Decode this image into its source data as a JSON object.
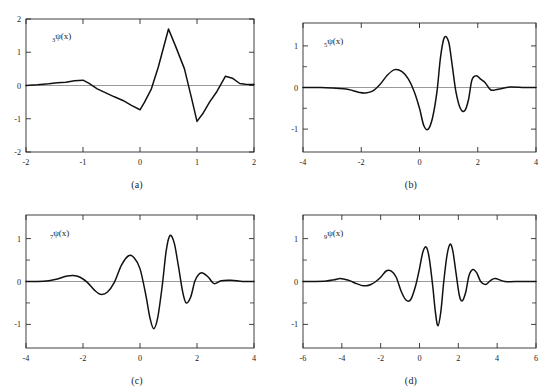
{
  "figure": {
    "background": "#ffffff",
    "axis_color": "#2b2b2b",
    "curve_color": "#111111",
    "zero_line_color": "#6f6f6f"
  },
  "panels": [
    {
      "id": "a",
      "caption": "(a)",
      "curve_label_sub": "3",
      "curve_label_main": "ψ(x)"
    },
    {
      "id": "b",
      "caption": "(b)",
      "curve_label_sub": "5",
      "curve_label_main": "ψ(x)"
    },
    {
      "id": "c",
      "caption": "(c)",
      "curve_label_sub": "7",
      "curve_label_main": "ψ(x)"
    },
    {
      "id": "d",
      "caption": "(d)",
      "curve_label_sub": "9",
      "curve_label_main": "ψ(x)"
    }
  ],
  "chart_data": [
    {
      "type": "line",
      "panel": "a",
      "title": "",
      "annotation": "3ψ(x)",
      "xlabel": "",
      "ylabel": "",
      "xlim": [
        -2,
        2
      ],
      "ylim": [
        -2,
        2
      ],
      "xticks": [
        -2,
        -1,
        0,
        1,
        2
      ],
      "xticklabels": [
        "-2",
        "-1",
        "0",
        "1",
        "2"
      ],
      "yticks": [
        -2,
        -1,
        0,
        1,
        2
      ],
      "yticklabels": [
        "-2",
        "-1",
        "0",
        "1",
        "2"
      ],
      "grid": false,
      "legend": "none",
      "zero_line": true,
      "interpolation": "linear",
      "x": [
        -2.0,
        -1.8,
        -1.6,
        -1.45,
        -1.3,
        -1.15,
        -1.0,
        -0.9,
        -0.75,
        -0.6,
        -0.45,
        -0.3,
        -0.15,
        0.0,
        0.08,
        0.2,
        0.32,
        0.5,
        0.62,
        0.78,
        0.9,
        1.0,
        1.1,
        1.22,
        1.35,
        1.5,
        1.62,
        1.75,
        1.85,
        2.0
      ],
      "values": [
        0.0,
        0.02,
        0.05,
        0.08,
        0.1,
        0.14,
        0.16,
        0.07,
        -0.1,
        -0.22,
        -0.34,
        -0.45,
        -0.6,
        -0.73,
        -0.5,
        -0.1,
        0.55,
        1.7,
        1.2,
        0.5,
        -0.35,
        -1.08,
        -0.85,
        -0.5,
        -0.18,
        0.28,
        0.22,
        0.06,
        0.04,
        0.03
      ]
    },
    {
      "type": "line",
      "panel": "b",
      "title": "",
      "annotation": "5ψ(x)",
      "xlabel": "",
      "ylabel": "",
      "xlim": [
        -4,
        4
      ],
      "ylim": [
        -1.55,
        1.55
      ],
      "xticks": [
        -4,
        -2,
        0,
        2,
        4
      ],
      "xticklabels": [
        "-4",
        "-2",
        "0",
        "2",
        "4"
      ],
      "yticks": [
        -1,
        0,
        1
      ],
      "yticklabels": [
        "-1",
        "0",
        "1"
      ],
      "yminorticks": [
        -0.5,
        0.5
      ],
      "grid": false,
      "legend": "none",
      "zero_line": true,
      "interpolation": "smooth",
      "x": [
        -4.0,
        -3.4,
        -3.0,
        -2.6,
        -2.3,
        -2.05,
        -1.85,
        -1.6,
        -1.35,
        -1.1,
        -0.85,
        -0.6,
        -0.38,
        -0.18,
        0.0,
        0.15,
        0.3,
        0.45,
        0.6,
        0.72,
        0.85,
        1.0,
        1.12,
        1.25,
        1.4,
        1.55,
        1.68,
        1.8,
        1.95,
        2.1,
        2.25,
        2.45,
        2.7,
        3.1,
        3.6,
        4.0
      ],
      "values": [
        0.0,
        0.0,
        -0.01,
        -0.03,
        -0.07,
        -0.12,
        -0.13,
        -0.08,
        0.08,
        0.3,
        0.43,
        0.38,
        0.2,
        -0.1,
        -0.5,
        -0.92,
        -1.0,
        -0.72,
        -0.1,
        0.72,
        1.2,
        1.1,
        0.55,
        -0.1,
        -0.5,
        -0.56,
        -0.3,
        0.18,
        0.28,
        0.2,
        0.12,
        -0.06,
        -0.04,
        0.01,
        0.0,
        0.0
      ]
    },
    {
      "type": "line",
      "panel": "c",
      "title": "",
      "annotation": "7ψ(x)",
      "xlabel": "",
      "ylabel": "",
      "xlim": [
        -4,
        4
      ],
      "ylim": [
        -1.55,
        1.55
      ],
      "xticks": [
        -4,
        -2,
        0,
        2,
        4
      ],
      "xticklabels": [
        "-4",
        "-2",
        "0",
        "2",
        "4"
      ],
      "yticks": [
        -1,
        0,
        1
      ],
      "yticklabels": [
        "-1",
        "0",
        "1"
      ],
      "yminorticks": [
        -0.5,
        0.5
      ],
      "grid": false,
      "legend": "none",
      "zero_line": true,
      "interpolation": "smooth",
      "x": [
        -4.0,
        -3.6,
        -3.2,
        -2.9,
        -2.6,
        -2.35,
        -2.1,
        -1.85,
        -1.6,
        -1.38,
        -1.15,
        -0.9,
        -0.65,
        -0.4,
        -0.2,
        0.0,
        0.2,
        0.35,
        0.48,
        0.62,
        0.78,
        0.92,
        1.05,
        1.2,
        1.35,
        1.5,
        1.62,
        1.78,
        1.92,
        2.05,
        2.2,
        2.4,
        2.6,
        2.85,
        3.2,
        3.6,
        4.0
      ],
      "values": [
        0.0,
        0.0,
        0.02,
        0.06,
        0.12,
        0.14,
        0.1,
        -0.02,
        -0.2,
        -0.3,
        -0.25,
        -0.02,
        0.38,
        0.6,
        0.55,
        0.3,
        -0.3,
        -0.85,
        -1.1,
        -0.85,
        -0.1,
        0.72,
        1.07,
        0.9,
        0.35,
        -0.25,
        -0.5,
        -0.36,
        0.0,
        0.16,
        0.2,
        0.1,
        -0.05,
        0.02,
        0.03,
        0.0,
        0.0
      ]
    },
    {
      "type": "line",
      "panel": "d",
      "title": "",
      "annotation": "9ψ(x)",
      "xlabel": "",
      "ylabel": "",
      "xlim": [
        -6,
        6
      ],
      "ylim": [
        -1.55,
        1.55
      ],
      "xticks": [
        -6,
        -4,
        -2,
        0,
        2,
        4,
        6
      ],
      "xticklabels": [
        "-6",
        "-4",
        "-2",
        "0",
        "2",
        "4",
        "6"
      ],
      "yticks": [
        -1,
        0,
        1
      ],
      "yticklabels": [
        "-1",
        "0",
        "1"
      ],
      "yminorticks": [
        -0.5,
        0.5
      ],
      "grid": false,
      "legend": "none",
      "zero_line": true,
      "interpolation": "smooth",
      "x": [
        -6.0,
        -5.4,
        -4.8,
        -4.4,
        -4.1,
        -3.85,
        -3.6,
        -3.3,
        -3.0,
        -2.75,
        -2.5,
        -2.25,
        -2.0,
        -1.7,
        -1.45,
        -1.2,
        -0.95,
        -0.7,
        -0.45,
        -0.2,
        0.0,
        0.18,
        0.35,
        0.5,
        0.68,
        0.82,
        0.95,
        1.1,
        1.25,
        1.42,
        1.58,
        1.72,
        1.88,
        2.05,
        2.2,
        2.38,
        2.55,
        2.75,
        2.95,
        3.15,
        3.4,
        3.65,
        3.9,
        4.4,
        5.2,
        6.0
      ],
      "values": [
        0.0,
        0.0,
        0.01,
        0.04,
        0.07,
        0.05,
        0.02,
        -0.04,
        -0.09,
        -0.1,
        -0.07,
        0.0,
        0.1,
        0.25,
        0.24,
        0.1,
        -0.22,
        -0.43,
        -0.42,
        -0.1,
        0.3,
        0.7,
        0.8,
        0.55,
        -0.1,
        -0.72,
        -1.03,
        -0.7,
        0.0,
        0.62,
        0.87,
        0.7,
        0.2,
        -0.32,
        -0.45,
        -0.25,
        0.14,
        0.28,
        0.2,
        0.0,
        -0.07,
        0.02,
        0.07,
        0.0,
        0.0,
        0.0
      ]
    }
  ]
}
